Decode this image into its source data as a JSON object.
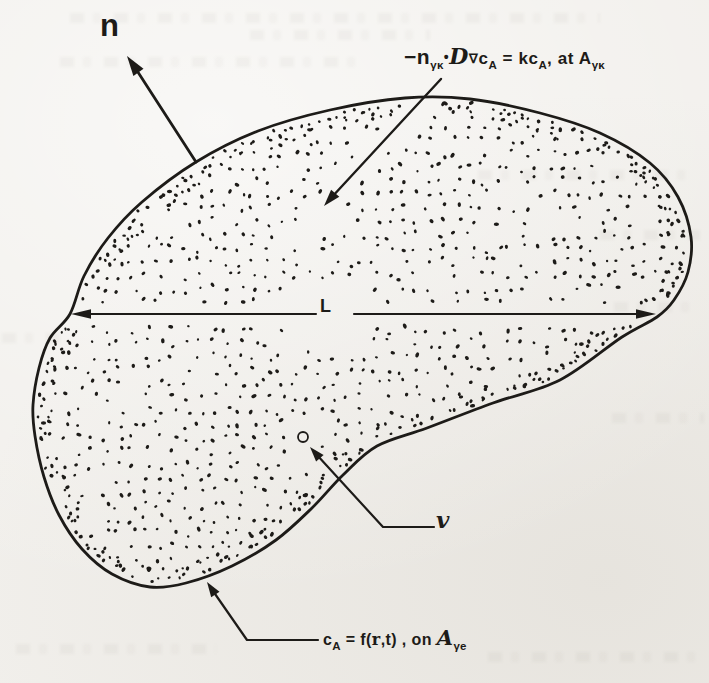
{
  "page": {
    "paper_color": "#f1efeb",
    "ink_color": "#1d1b18"
  },
  "labels": {
    "normal_vector": "n",
    "length": "L",
    "velocity": "v",
    "flux_bc": {
      "minus_n": "−n",
      "sub_gamma_kappa_1": "γκ",
      "cdot": "•",
      "script_D": "D",
      "nabla": "∇",
      "c1": "c",
      "sub_A1": "A",
      "equals_kc": " = kc",
      "sub_A2": "A",
      "comma_at": ", at A",
      "sub_gamma_kappa_2": "γκ"
    },
    "entrance_bc": {
      "c": "c",
      "sub_A": "A",
      "equals_f": " = f(",
      "r_vector": "r",
      "t_close": ",t) , on ",
      "script_A": "A",
      "sub_gamma_e": "γe"
    }
  }
}
